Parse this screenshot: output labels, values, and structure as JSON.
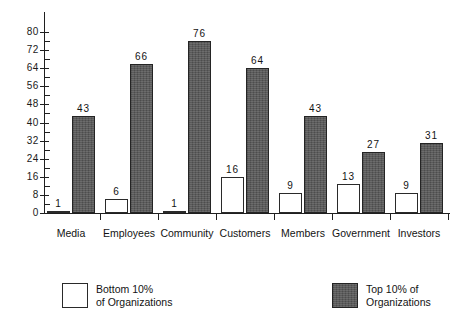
{
  "chart_data": {
    "type": "bar",
    "title": "",
    "subtitle": "",
    "xlabel": "",
    "ylabel": "",
    "ylim": [
      0,
      80
    ],
    "ytick_labels": [
      "0",
      "8",
      "16",
      "24",
      "32",
      "40",
      "48",
      "56",
      "64",
      "72",
      "80"
    ],
    "ytick_values": [
      0,
      8,
      16,
      24,
      32,
      40,
      48,
      56,
      64,
      72,
      80
    ],
    "ytick_step": 8,
    "minor_ticks": true,
    "grid": false,
    "legend_position": "below-plot",
    "categories": [
      "Media",
      "Employees",
      "Community",
      "Customers",
      "Members",
      "Government",
      "Investors"
    ],
    "series": [
      {
        "name": "Bottom 10% of Organizations",
        "style": "hollow",
        "color": "#ffffff",
        "edge_color": "#2a2a2a",
        "values": [
          1,
          6,
          1,
          16,
          9,
          13,
          9
        ],
        "labels": [
          "1",
          "6",
          "1",
          "16",
          "9",
          "13",
          "9"
        ]
      },
      {
        "name": "Top 10% of Organizations",
        "style": "solid",
        "color": "#5b5b5b",
        "edge_color": "#242424",
        "values": [
          43,
          66,
          76,
          64,
          43,
          27,
          31
        ],
        "labels": [
          "43",
          "66",
          "76",
          "64",
          "43",
          "27",
          "31"
        ]
      }
    ]
  },
  "legend": {
    "items": [
      {
        "swatch": "hollow-square-swatch",
        "line1": "Bottom  10%",
        "line2": "of  Organizations"
      },
      {
        "swatch": "filled-square-swatch",
        "line1": "Top 10% of",
        "line2": "Organizations"
      }
    ]
  },
  "colors": {
    "axis": "#1f1f1f",
    "text": "#131313",
    "series_top": "#5b5b5b",
    "series_bottom": "#ffffff",
    "background": "#ffffff"
  }
}
